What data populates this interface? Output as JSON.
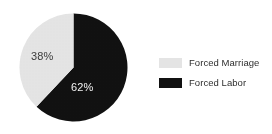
{
  "chart_data": {
    "type": "pie",
    "title": "",
    "categories": [
      "Forced Labor",
      "Forced Marriage"
    ],
    "values": [
      62,
      38
    ],
    "value_unit": "%",
    "slices": [
      {
        "label": "Forced Labor",
        "value": 62,
        "display_value": "62%",
        "color": "#111111",
        "label_color": "#f2f2f2",
        "start_angle_deg": 0,
        "sweep_deg": 223.2
      },
      {
        "label": "Forced Marriage",
        "value": 38,
        "display_value": "38%",
        "color": "#e4e4e4",
        "label_color": "#3b3b3b",
        "start_angle_deg": 223.2,
        "sweep_deg": 136.8
      }
    ],
    "start_angle": "12 o'clock",
    "direction": "clockwise",
    "legend_position": "right",
    "grid": false,
    "xlabel": "",
    "ylabel": ""
  },
  "legend": {
    "items": [
      {
        "label": "Forced Marriage",
        "swatch_color": "#e4e4e4"
      },
      {
        "label": "Forced Labor",
        "swatch_color": "#111111"
      }
    ]
  },
  "labels": {
    "forced_marriage_pct": "38%",
    "forced_labor_pct": "62%"
  },
  "colors": {
    "background": "#ffffff",
    "forced_labor": "#111111",
    "forced_marriage": "#e4e4e4",
    "text": "#2e2e2e"
  }
}
